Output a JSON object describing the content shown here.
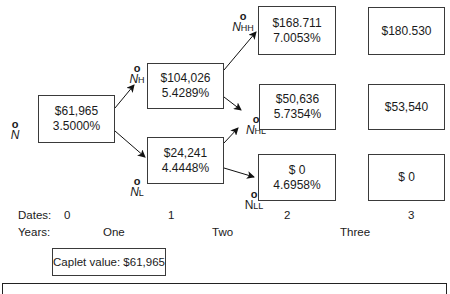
{
  "nodes": {
    "root": {
      "label": "N",
      "sub": "",
      "value": "$61,965",
      "rate": "3.5000%"
    },
    "H": {
      "label": "N",
      "sub": "H",
      "value": "$104,026",
      "rate": "5.4289%"
    },
    "L": {
      "label": "N",
      "sub": "L",
      "value": "$24,241",
      "rate": "4.4448%"
    },
    "HH": {
      "label": "N",
      "sub": "HH",
      "value": "$168.711",
      "rate": "7.0053%"
    },
    "HL": {
      "label": "N",
      "sub": "HL",
      "value": "$50,636",
      "rate": "5.7354%"
    },
    "LL": {
      "label": "N",
      "sub": "LL",
      "value": "$ 0",
      "rate": "4.6958%"
    }
  },
  "terminal": {
    "HHH": "$180.530",
    "HHL": "$53,540",
    "LLL": "$ 0"
  },
  "node_marker": "o",
  "dates": {
    "label": "Dates:",
    "values": [
      "0",
      "1",
      "2",
      "3"
    ]
  },
  "years": {
    "label": "Years:",
    "values": [
      "One",
      "Two",
      "Three"
    ]
  },
  "caplet": {
    "text": "Caplet value: $61,965"
  }
}
